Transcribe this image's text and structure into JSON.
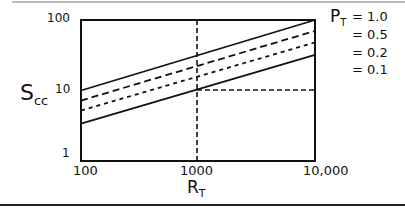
{
  "chart_data": {
    "type": "line",
    "title": "",
    "xlabel": "R_T",
    "ylabel": "S_cc",
    "xscale": "log",
    "yscale": "log",
    "xlim": [
      100,
      10000
    ],
    "ylim": [
      1,
      100
    ],
    "x_ticks": [
      "100",
      "1000",
      "10,000"
    ],
    "y_ticks": [
      "1",
      "10",
      "100"
    ],
    "legend_title": "P_T",
    "legend_position": "right",
    "grid": false,
    "annotations": [
      "dashed vertical reference line at R_T = 1000",
      "dashed horizontal reference line at S_cc = 10 from R_T = 1000 to 10,000"
    ],
    "x": [
      100,
      10000
    ],
    "series": [
      {
        "name": "= 1.0",
        "style": "solid",
        "values": [
          10,
          100
        ]
      },
      {
        "name": "= 0.5",
        "style": "dashed",
        "values": [
          7.2,
          70
        ]
      },
      {
        "name": "= 0.2",
        "style": "dotted",
        "values": [
          5.2,
          48
        ]
      },
      {
        "name": "= 0.1",
        "style": "solid",
        "values": [
          3.4,
          32
        ]
      }
    ]
  },
  "axes": {
    "y_ticks": [
      {
        "label": "100",
        "value": 100
      },
      {
        "label": "10",
        "value": 10
      },
      {
        "label": "1",
        "value": 1
      }
    ],
    "x_ticks": [
      {
        "label": "100",
        "value": 100
      },
      {
        "label": "1000",
        "value": 1000
      },
      {
        "label": "10,000",
        "value": 10000
      }
    ],
    "ylabel_main": "S",
    "ylabel_sub": "cc",
    "xlabel_main": "R",
    "xlabel_sub": "T"
  },
  "legend": {
    "title_main": "P",
    "title_sub": "T",
    "items": [
      "= 1.0",
      "= 0.5",
      "= 0.2",
      "= 0.1"
    ]
  }
}
